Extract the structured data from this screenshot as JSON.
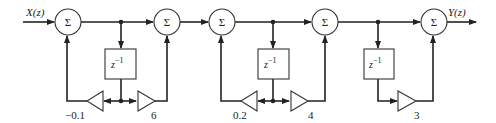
{
  "diagram": {
    "type": "signal-flow block diagram (cascade form, three sections)",
    "input_label": "X(z)",
    "output_label": "Y(z)",
    "summer_symbol": "Σ",
    "delay_label": "z",
    "delay_exponent": "−1",
    "summers": [
      {
        "id": "sum1",
        "cx": 68,
        "cy": 22
      },
      {
        "id": "sum2",
        "cx": 167,
        "cy": 22
      },
      {
        "id": "sum3",
        "cx": 222,
        "cy": 22
      },
      {
        "id": "sum4",
        "cx": 325,
        "cy": 22
      },
      {
        "id": "sum5",
        "cx": 434,
        "cy": 22
      }
    ],
    "delays": [
      {
        "id": "delay1",
        "x": 105,
        "y": 49,
        "w": 31,
        "h": 30
      },
      {
        "id": "delay2",
        "x": 258,
        "y": 49,
        "w": 31,
        "h": 30
      },
      {
        "id": "delay3",
        "x": 364,
        "y": 49,
        "w": 30,
        "h": 30
      }
    ],
    "gains": [
      {
        "id": "gain1",
        "value": "−0.1",
        "direction": "left",
        "section": 1
      },
      {
        "id": "gain2",
        "value": "6",
        "direction": "right",
        "section": 1
      },
      {
        "id": "gain3",
        "value": "0.2",
        "direction": "left",
        "section": 2
      },
      {
        "id": "gain4",
        "value": "4",
        "direction": "right",
        "section": 2
      },
      {
        "id": "gain5",
        "value": "3",
        "direction": "right",
        "section": 3
      }
    ]
  }
}
